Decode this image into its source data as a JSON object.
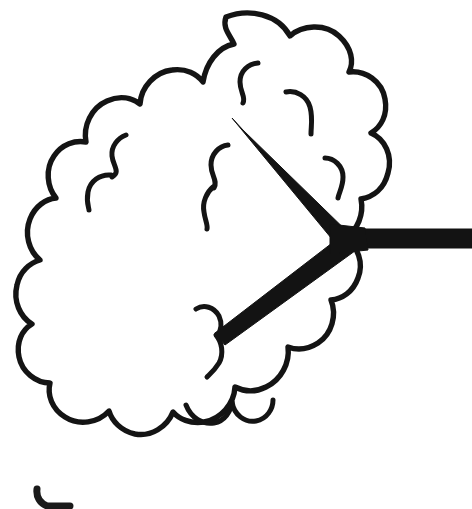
{
  "figure": {
    "description": "Black ink line drawing on a white background: a scalloped cloud-shaped closed outline containing several short interior curl marks, overlaid by a thick solid three-pronged junction whose horizontal prong extends past the cloud to the right edge of the image.",
    "background_color": "#ffffff",
    "ink_color": "#141414",
    "canvas": {
      "width": 472,
      "height": 509
    },
    "elements": {
      "cloud_outline": {
        "name": "cloud-outline",
        "shape": "scalloped closed curve",
        "bump_count": 14,
        "bounds": {
          "x": 22,
          "y": 10,
          "width": 340,
          "height": 435
        }
      },
      "interior_curls": {
        "name": "interior-curl-marks",
        "count": 9,
        "description": "short hooked arcs suggesting puffs inside the cloud"
      },
      "connector": {
        "name": "three-pronged-connector",
        "stroke_style": "solid thick black",
        "junction_point": {
          "x": 349,
          "y": 238
        },
        "prongs": [
          {
            "label": "upper-left-prong",
            "from": {
              "x": 349,
              "y": 238
            },
            "to": {
              "x": 229,
              "y": 124
            }
          },
          {
            "label": "lower-left-prong",
            "from": {
              "x": 349,
              "y": 238
            },
            "to": {
              "x": 216,
              "y": 340
            }
          },
          {
            "label": "right-prong",
            "from": {
              "x": 349,
              "y": 238
            },
            "to": {
              "x": 472,
              "y": 238
            },
            "note": "extends to image edge"
          }
        ]
      },
      "bottom_fragment": {
        "name": "cropped-figure-fragment",
        "description": "small hooked corner mark, partially cut off by the bottom edge",
        "bounds": {
          "x": 33,
          "y": 487,
          "width": 40,
          "height": 22
        }
      }
    }
  }
}
